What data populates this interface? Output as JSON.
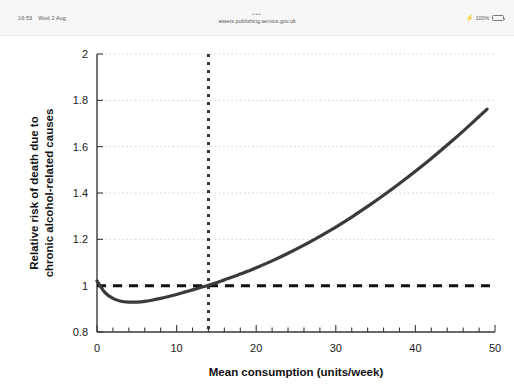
{
  "browser": {
    "status_time": "16:53",
    "status_date": "Wed 2 Aug",
    "url_overflow_glyph": "•••",
    "url": "assets.publishing.service.gov.uk",
    "battery_percent": "100%",
    "charging_glyph": "⚡"
  },
  "chart_data": {
    "type": "line",
    "title": "",
    "xlabel": "Mean consumption (units/week)",
    "ylabel": "Relative risk of death due to chronic alcohol-related causes",
    "ylabel_line1": "Relative risk of death due to",
    "ylabel_line2": "chronic alcohol-related causes",
    "xlim": [
      0,
      50
    ],
    "ylim": [
      0.8,
      2.0
    ],
    "xticks": [
      0,
      10,
      20,
      30,
      40,
      50
    ],
    "xtick_labels": [
      "0",
      "10",
      "20",
      "30",
      "40",
      "50"
    ],
    "xminor_step": 2,
    "yticks": [
      0.8,
      1.0,
      1.2,
      1.4,
      1.6,
      1.8,
      2.0
    ],
    "ytick_labels": [
      "0.8",
      "1",
      "1.2",
      "1.4",
      "1.6",
      "1.8",
      "2"
    ],
    "grid": "horizontal-dotted",
    "legend": "none",
    "series": [
      {
        "name": "Relative risk curve",
        "color": "#3a3a3a",
        "style": "solid",
        "x": [
          0,
          1,
          2,
          3,
          4,
          5,
          6,
          7,
          8,
          9,
          10,
          11,
          12,
          13,
          14,
          15,
          16,
          17,
          18,
          19,
          20,
          22,
          24,
          26,
          28,
          30,
          32,
          34,
          36,
          38,
          40,
          42,
          44,
          46,
          48,
          49
        ],
        "y": [
          1.02,
          0.97,
          0.945,
          0.933,
          0.929,
          0.929,
          0.932,
          0.938,
          0.945,
          0.953,
          0.962,
          0.972,
          0.982,
          0.992,
          1.002,
          1.013,
          1.025,
          1.037,
          1.05,
          1.063,
          1.077,
          1.107,
          1.14,
          1.175,
          1.213,
          1.253,
          1.296,
          1.342,
          1.39,
          1.441,
          1.494,
          1.549,
          1.607,
          1.667,
          1.73,
          1.762
        ]
      }
    ],
    "reference_lines": [
      {
        "name": "baseline-risk",
        "orientation": "horizontal",
        "value": 1.0,
        "style": "dashed",
        "color": "#111111"
      },
      {
        "name": "guideline-threshold",
        "orientation": "vertical",
        "value": 14,
        "style": "dotted",
        "color": "#333333"
      }
    ]
  }
}
